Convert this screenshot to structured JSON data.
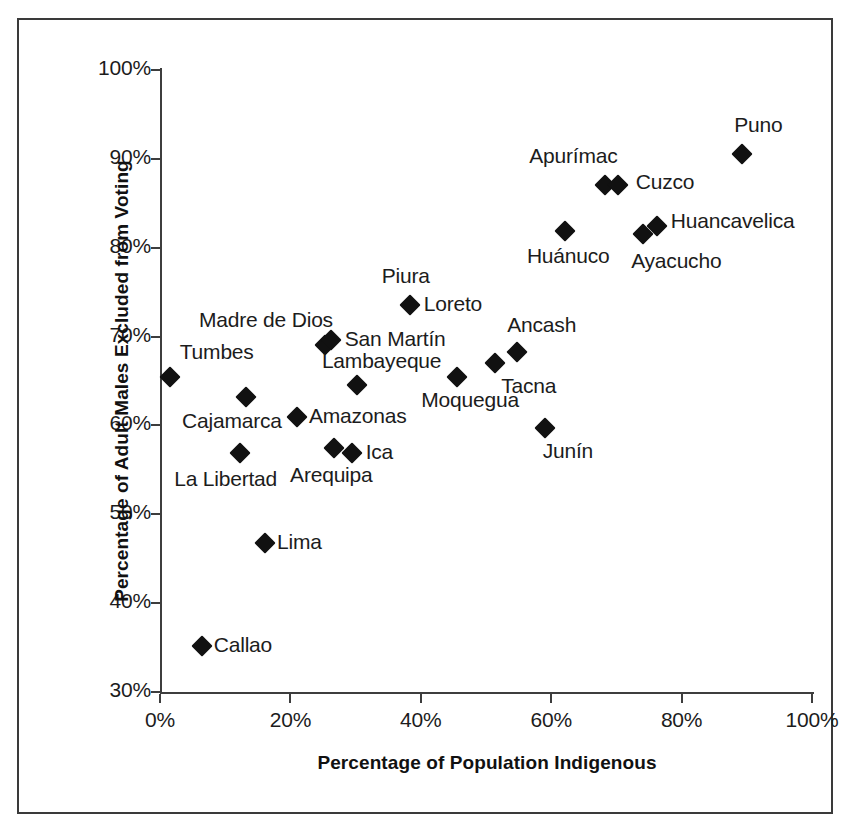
{
  "chart_data": {
    "type": "scatter",
    "title": "",
    "xlabel": "Percentage of Population Indigenous",
    "ylabel": "Percentage of Adult Males Excluded from Voting",
    "xlim": [
      0,
      100
    ],
    "ylim": [
      30,
      100
    ],
    "xticks": [
      "0%",
      "20%",
      "40%",
      "60%",
      "80%",
      "100%"
    ],
    "xtick_values": [
      0,
      20,
      40,
      60,
      80,
      100
    ],
    "yticks": [
      "30%",
      "40%",
      "50%",
      "60%",
      "70%",
      "80%",
      "90%",
      "100%"
    ],
    "ytick_values": [
      30,
      40,
      50,
      60,
      70,
      80,
      90,
      100
    ],
    "grid": false,
    "legend": "none",
    "marker": "diamond",
    "marker_color": "#111111",
    "points": [
      {
        "label": "Tumbes",
        "x": 1.5,
        "y": 65.5,
        "label_dx": 10,
        "label_dy": -24
      },
      {
        "label": "Callao",
        "x": 6.4,
        "y": 35.2,
        "label_dx": 12,
        "label_dy": 0
      },
      {
        "label": "La Libertad",
        "x": 12.3,
        "y": 56.9,
        "label_dx": -66,
        "label_dy": 27
      },
      {
        "label": "Cajamarca",
        "x": 13.2,
        "y": 63.2,
        "label_dx": -64,
        "label_dy": 25
      },
      {
        "label": "Lima",
        "x": 16.1,
        "y": 46.8,
        "label_dx": 12,
        "label_dy": 0
      },
      {
        "label": "Amazonas",
        "x": 21.0,
        "y": 61.0,
        "label_dx": 12,
        "label_dy": 0
      },
      {
        "label": "Madre de Dios",
        "x": 25.3,
        "y": 69.1,
        "label_dx": -126,
        "label_dy": -24
      },
      {
        "label": "San Martín",
        "x": 26.2,
        "y": 69.6,
        "label_dx": 14,
        "label_dy": 0
      },
      {
        "label": "Arequipa",
        "x": 26.7,
        "y": 57.5,
        "label_dx": -44,
        "label_dy": 28
      },
      {
        "label": "Ica",
        "x": 29.4,
        "y": 56.9,
        "label_dx": 14,
        "label_dy": 0
      },
      {
        "label": "Lambayeque",
        "x": 30.2,
        "y": 64.6,
        "label_dx": -35,
        "label_dy": -23
      },
      {
        "label": "Piura",
        "x": 38.3,
        "y": 73.5,
        "label_dx": -28,
        "label_dy": -28
      },
      {
        "label": "Loreto",
        "x": 38.3,
        "y": 73.5,
        "label_dx": 14,
        "label_dy": 0
      },
      {
        "label": "Moquegua",
        "x": 45.6,
        "y": 65.4,
        "label_dx": -36,
        "label_dy": 24
      },
      {
        "label": "Tacna",
        "x": 51.4,
        "y": 67.0,
        "label_dx": 6,
        "label_dy": 24
      },
      {
        "label": "Ancash",
        "x": 54.8,
        "y": 68.3,
        "label_dx": -10,
        "label_dy": -26
      },
      {
        "label": "Junín",
        "x": 59.0,
        "y": 59.7,
        "label_dx": -2,
        "label_dy": 24
      },
      {
        "label": "Huánuco",
        "x": 62.1,
        "y": 81.9,
        "label_dx": -38,
        "label_dy": 26
      },
      {
        "label": "Apurímac",
        "x": 68.3,
        "y": 87.1,
        "label_dx": -76,
        "label_dy": -28
      },
      {
        "label": "Cuzco",
        "x": 70.2,
        "y": 87.1,
        "label_dx": 18,
        "label_dy": -2
      },
      {
        "label": "Ayacucho",
        "x": 74.1,
        "y": 81.5,
        "label_dx": -12,
        "label_dy": 28
      },
      {
        "label": "Huancavelica",
        "x": 76.2,
        "y": 82.4,
        "label_dx": 14,
        "label_dy": -4
      },
      {
        "label": "Puno",
        "x": 89.3,
        "y": 90.6,
        "label_dx": -8,
        "label_dy": -28
      }
    ]
  }
}
